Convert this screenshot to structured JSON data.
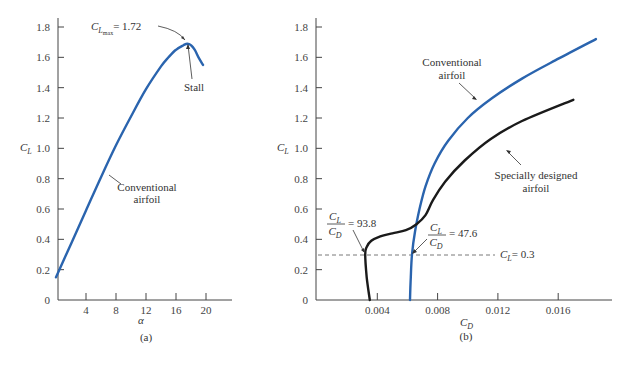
{
  "chart_data": [
    {
      "id": "a",
      "type": "line",
      "caption": "(a)",
      "xlabel": "α",
      "ylabel": "C_L",
      "xlim": [
        0,
        23
      ],
      "ylim": [
        0,
        1.8
      ],
      "xticks": [
        4,
        8,
        12,
        16,
        20
      ],
      "yticks": [
        0,
        0.2,
        0.4,
        0.6,
        0.8,
        1.0,
        1.2,
        1.4,
        1.6,
        1.8
      ],
      "yticklabels": [
        "0",
        "0.2",
        "0.4",
        "0.6",
        "0.8",
        "1.0",
        "1.2",
        "1.4",
        "1.6",
        "1.8"
      ],
      "grid": false,
      "series": [
        {
          "name": "Conventional airfoil",
          "color": "#2a64ae",
          "x": [
            0,
            2,
            4,
            6,
            8,
            10,
            12,
            14,
            15,
            16,
            17,
            17.5,
            18,
            18.5,
            19,
            19.6
          ],
          "y": [
            0.15,
            0.37,
            0.59,
            0.81,
            1.02,
            1.21,
            1.39,
            1.54,
            1.6,
            1.65,
            1.68,
            1.69,
            1.68,
            1.65,
            1.6,
            1.55
          ]
        }
      ],
      "annotations": [
        {
          "text_main": "C",
          "text_sub": "L",
          "text_subsub": "max",
          "text_rest": "= 1.72",
          "x": 17.5,
          "y": 1.72
        },
        {
          "text": "Stall",
          "x": 17.5,
          "y": 1.69
        },
        {
          "text": [
            "Conventional",
            "airfoil"
          ],
          "x": 7.6,
          "y": 1.02
        }
      ]
    },
    {
      "id": "b",
      "type": "line",
      "caption": "(b)",
      "xlabel": "C_D",
      "ylabel": "C_L",
      "xlim": [
        0,
        0.0196
      ],
      "ylim": [
        0,
        1.8
      ],
      "xticks": [
        0.004,
        0.008,
        0.012,
        0.016
      ],
      "xticklabels": [
        "0.004",
        "0.008",
        "0.012",
        "0.016"
      ],
      "yticks": [
        0,
        0.2,
        0.4,
        0.6,
        0.8,
        1.0,
        1.2,
        1.4,
        1.6,
        1.8
      ],
      "yticklabels": [
        "0",
        "0.2",
        "0.4",
        "0.6",
        "0.8",
        "1.0",
        "1.2",
        "1.4",
        "1.6",
        "1.8"
      ],
      "grid": false,
      "series": [
        {
          "name": "Conventional airfoil",
          "color": "#2a64ae",
          "x": [
            0.00617,
            0.00622,
            0.0063,
            0.0065,
            0.0068,
            0.0072,
            0.0078,
            0.0087,
            0.01,
            0.0116,
            0.0136,
            0.0158,
            0.0185
          ],
          "y": [
            0.0,
            0.15,
            0.3,
            0.45,
            0.6,
            0.75,
            0.9,
            1.05,
            1.2,
            1.33,
            1.46,
            1.58,
            1.72
          ]
        },
        {
          "name": "Specially designed airfoil",
          "color": "#1a1a1a",
          "x": [
            0.0035,
            0.0033,
            0.0032,
            0.0033,
            0.0036,
            0.0042,
            0.005,
            0.0059,
            0.0066,
            0.0072,
            0.0077,
            0.0085,
            0.0098,
            0.0115,
            0.0136,
            0.017
          ],
          "y": [
            0.0,
            0.15,
            0.3,
            0.35,
            0.39,
            0.42,
            0.44,
            0.46,
            0.5,
            0.56,
            0.66,
            0.78,
            0.92,
            1.06,
            1.18,
            1.32
          ]
        }
      ],
      "reference_line": {
        "label_main": "C",
        "label_sub": "L",
        "label_rest": "= 0.3",
        "y": 0.3
      },
      "annotations": [
        {
          "ratio_num": "C",
          "ratio_num_sub": "L",
          "ratio_den": "C",
          "ratio_den_sub": "D",
          "value": "= 93.8",
          "x": 0.0032,
          "y": 0.3
        },
        {
          "ratio_num": "C",
          "ratio_num_sub": "L",
          "ratio_den": "C",
          "ratio_den_sub": "D",
          "value": "= 47.6",
          "x": 0.0063,
          "y": 0.3
        },
        {
          "text": [
            "Conventional",
            "airfoil"
          ],
          "x": 0.0106,
          "y": 1.27
        },
        {
          "text": [
            "Specially designed",
            "airfoil"
          ],
          "x": 0.0122,
          "y": 1.03
        }
      ]
    }
  ],
  "labels": {
    "a_title_cl": "C",
    "a_title_cl_sub": "L",
    "a_xlabel": "α",
    "a_caption": "(a)",
    "a_cmax_main": "C",
    "a_cmax_sub": "L",
    "a_cmax_subsub": "max",
    "a_cmax_rest": "= 1.72",
    "a_stall": "Stall",
    "a_conv1": "Conventional",
    "a_conv2": "airfoil",
    "b_ylabel": "C",
    "b_ylabel_sub": "L",
    "b_xlabel": "C",
    "b_xlabel_sub": "D",
    "b_caption": "(b)",
    "b_conv1": "Conventional",
    "b_conv2": "airfoil",
    "b_spec1": "Specially designed",
    "b_spec2": "airfoil",
    "b_ref_main": "C",
    "b_ref_sub": "L",
    "b_ref_rest": "= 0.3",
    "b_r1_num": "C",
    "b_r1_num_sub": "L",
    "b_r1_den": "C",
    "b_r1_den_sub": "D",
    "b_r1_val": "= 93.8",
    "b_r2_num": "C",
    "b_r2_num_sub": "L",
    "b_r2_den": "C",
    "b_r2_den_sub": "D",
    "b_r2_val": "= 47.6"
  }
}
